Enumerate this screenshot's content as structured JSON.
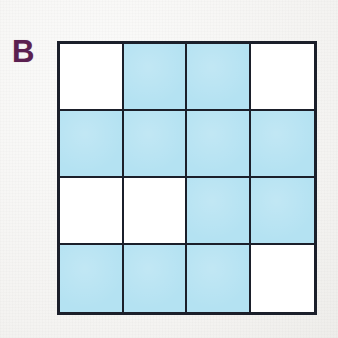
{
  "figure": {
    "panel_label": "B",
    "label_color": "#5b2050",
    "background_color": "#f6f5f3",
    "grid_line_color": "#1b1f2a",
    "fill_colors": {
      "filled": "#b4e2f2",
      "empty": "#ffffff"
    }
  },
  "chart_data": {
    "type": "heatmap",
    "title": "B",
    "xlabel": "",
    "ylabel": "",
    "rows": 4,
    "cols": 4,
    "categories_x": [
      "1",
      "2",
      "3",
      "4"
    ],
    "categories_y": [
      "1",
      "2",
      "3",
      "4"
    ],
    "legend": [
      {
        "label": "filled",
        "value": 1,
        "color": "#b4e2f2"
      },
      {
        "label": "empty",
        "value": 0,
        "color": "#ffffff"
      }
    ],
    "values": [
      [
        0,
        1,
        1,
        0
      ],
      [
        1,
        1,
        1,
        1
      ],
      [
        0,
        0,
        1,
        1
      ],
      [
        1,
        1,
        1,
        0
      ]
    ],
    "filled_count": 11,
    "total_count": 16,
    "grid": true
  }
}
